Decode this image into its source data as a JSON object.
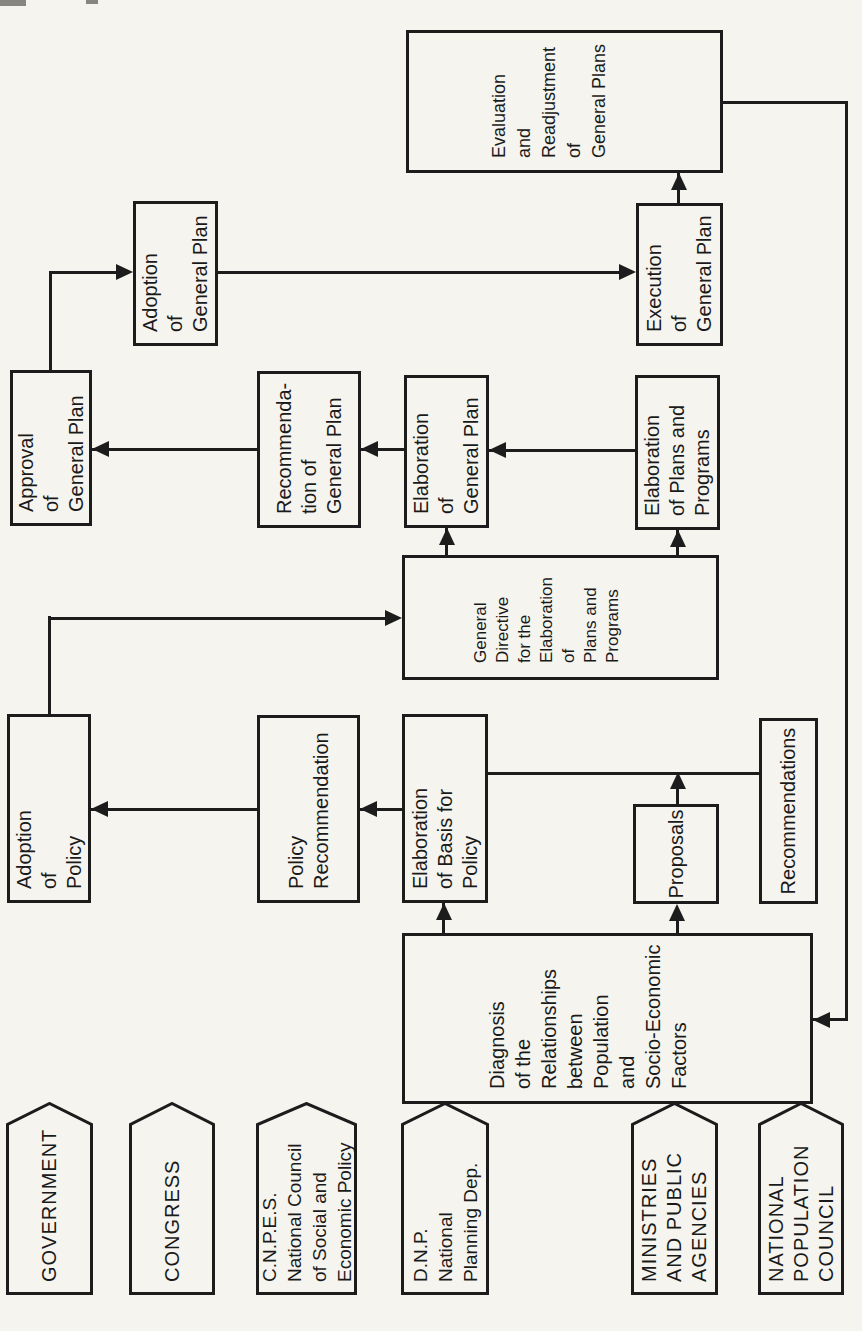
{
  "page": {
    "paper": "#f5f4ef",
    "ink": "#1c1c1c"
  },
  "lanes": [
    {
      "label": "GOVERNMENT"
    },
    {
      "label": "CONGRESS"
    },
    {
      "label": "C.N.P.E.S.\nNational Council\nof Social and\nEconomic Policy"
    },
    {
      "label": "D.N.P.\nNational\nPlanning Dep."
    },
    {
      "label": "MINISTRIES\nAND PUBLIC\nAGENCIES"
    },
    {
      "label": "NATIONAL\nPOPULATION\nCOUNCIL"
    }
  ],
  "boxes": {
    "diagnosis": {
      "text": "Diagnosis\nof the\nRelationships\nbetween\nPopulation\nand\nSocio-Economic\nFactors"
    },
    "elaboration_basis": {
      "text": "Elaboration\nof Basis for\nPolicy"
    },
    "proposals": {
      "text": "Proposals"
    },
    "recommendations": {
      "text": "Recommendations"
    },
    "policy_recommendation": {
      "text": "Policy\nRecommendation"
    },
    "adoption_policy": {
      "text": "Adoption\nof\nPolicy"
    },
    "general_directive": {
      "text": "General\nDirective\nfor the\nElaboration\nof\nPlans and\nPrograms"
    },
    "elaboration_general_plan": {
      "text": "Elaboration\nof\nGeneral Plan"
    },
    "elaboration_plans_programs": {
      "text": "Elaboration\nof Plans and\nPrograms"
    },
    "recommendation_general_plan": {
      "text": "Recommenda-\ntion of\nGeneral Plan"
    },
    "approval_general_plan": {
      "text": "Approval\nof\nGeneral Plan"
    },
    "adoption_general_plan": {
      "text": "Adoption\nof\nGeneral Plan"
    },
    "execution_general_plan": {
      "text": "Execution\nof\nGeneral Plan"
    },
    "evaluation_readjustment": {
      "text": "Evaluation\nand\nReadjustment\nof\nGeneral Plans"
    }
  }
}
